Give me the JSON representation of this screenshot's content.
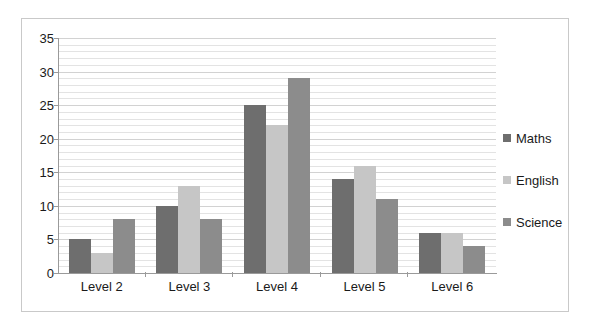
{
  "chart_data": {
    "type": "bar",
    "title": "",
    "xlabel": "",
    "ylabel": "",
    "categories": [
      "Level 2",
      "Level 3",
      "Level 4",
      "Level 5",
      "Level 6"
    ],
    "series": [
      {
        "name": "Maths",
        "color": "#6e6e6e",
        "values": [
          5,
          10,
          25,
          14,
          6
        ]
      },
      {
        "name": "English",
        "color": "#c6c6c6",
        "values": [
          3,
          13,
          22,
          16,
          6
        ]
      },
      {
        "name": "Science",
        "color": "#8c8c8c",
        "values": [
          8,
          8,
          29,
          11,
          4
        ]
      }
    ],
    "ylim": [
      0,
      35
    ],
    "ytick_step": 5,
    "yticks": [
      "35",
      "30",
      "25",
      "20",
      "15",
      "10",
      "5",
      "0"
    ],
    "minor_gridline_step": 1,
    "grid": true,
    "legend_position": "right"
  },
  "frame": {
    "border_color": "#c9c9c9",
    "background": "#ffffff"
  }
}
